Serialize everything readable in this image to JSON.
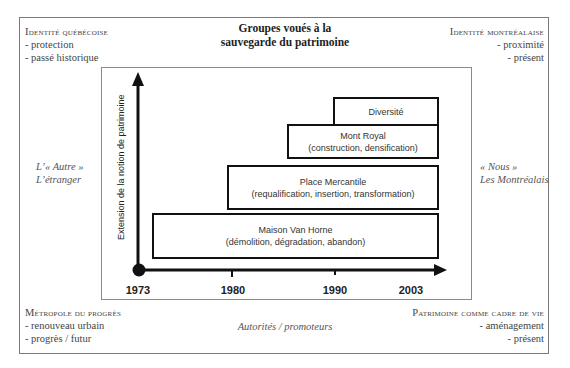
{
  "title": {
    "line1": "Groupes voués à la",
    "line2": "sauvegarde du patrimoine"
  },
  "corners": {
    "top_left": {
      "heading": "Identité québécoise",
      "items": [
        "- protection",
        "- passé historique"
      ]
    },
    "top_right": {
      "heading": "Identité montréalaise",
      "items": [
        "- proximité",
        "- présent"
      ]
    },
    "bottom_left": {
      "heading": "Métropole du progrès",
      "items": [
        "- renouveau urbain",
        "- progrès / futur"
      ]
    },
    "bottom_right": {
      "heading": "Patrimoine comme cadre de vie",
      "items": [
        "- aménagement",
        "- présent"
      ]
    }
  },
  "sides": {
    "left": {
      "line1": "L’« Autre »",
      "line2": "L’étranger"
    },
    "right": {
      "line1": "« Nous »",
      "line2": "Les Montréalais"
    }
  },
  "bottom_center": "Autorités / promoteurs",
  "axis": {
    "y_label": "Extension de la notion de patrimoine",
    "x_ticks": [
      "1973",
      "1980",
      "1990",
      "2003"
    ]
  },
  "boxes": [
    {
      "name": "Diversité",
      "detail": ""
    },
    {
      "name": "Mont Royal",
      "detail": "(construction, densification)"
    },
    {
      "name": "Place Mercantile",
      "detail": "(requalification, insertion, transformation)"
    },
    {
      "name": "Maison Van Horne",
      "detail": "(démolition, dégradation, abandon)"
    }
  ],
  "colors": {
    "frame": "#7a7a7a",
    "axis": "#111111",
    "text": "#333333"
  }
}
